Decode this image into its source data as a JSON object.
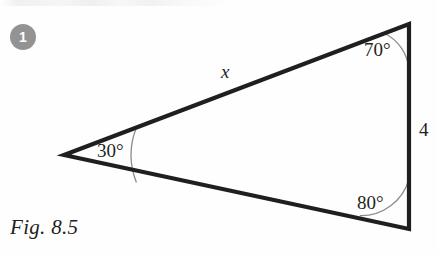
{
  "figure": {
    "caption": "Fig. 8.5",
    "item_number": "1",
    "background_color": "#fefefe",
    "stroke_color": "#1f1f22",
    "arc_color": "#8c8c90",
    "badge_color": "#939393"
  },
  "triangle": {
    "vertices": {
      "left": {
        "x": 64,
        "y": 155
      },
      "top": {
        "x": 409,
        "y": 24
      },
      "bottom": {
        "x": 409,
        "y": 229
      }
    },
    "angles": [
      {
        "name": "angle-at-top-vertex",
        "label": "70°",
        "value": 70,
        "arc_radius": 45
      },
      {
        "name": "angle-at-bottom-vertex",
        "label": "80°",
        "value": 80,
        "arc_radius": 50
      },
      {
        "name": "angle-at-left-vertex",
        "label": "30°",
        "value": 30,
        "arc_radius": 75
      }
    ],
    "sides": [
      {
        "name": "side-upper",
        "label": "x",
        "from": "left",
        "to": "top",
        "known": false
      },
      {
        "name": "side-right",
        "label": "4",
        "from": "top",
        "to": "bottom",
        "known": true
      },
      {
        "name": "side-lower",
        "label": "",
        "from": "bottom",
        "to": "left",
        "known": false
      }
    ]
  }
}
